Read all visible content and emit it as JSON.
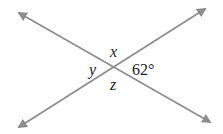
{
  "diagram": {
    "type": "intersecting-lines",
    "line_color": "#8c8c8c",
    "text_color": "#222222",
    "angles": {
      "top": "x",
      "left": "y",
      "bottom": "z",
      "right": "62°"
    },
    "lines": [
      {
        "name": "line-1",
        "from": [
          17,
          12
        ],
        "to": [
          212,
          123
        ]
      },
      {
        "name": "line-2",
        "from": [
          17,
          128
        ],
        "to": [
          207,
          8
        ]
      }
    ],
    "intersection": [
      115,
      68
    ]
  }
}
